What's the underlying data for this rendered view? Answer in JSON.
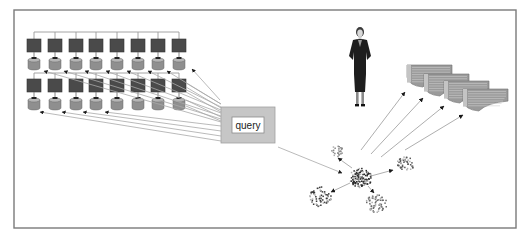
{
  "diagram": {
    "title": "",
    "frame": {
      "x": 14,
      "y": 10,
      "width": 502,
      "height": 218
    },
    "query_box": {
      "label": "query",
      "outer": {
        "x": 221,
        "y": 107,
        "width": 54,
        "height": 36
      },
      "inner": {
        "x": 232,
        "y": 117,
        "width": 32,
        "height": 16
      }
    },
    "node_grid": {
      "rows": 2,
      "columns": 8,
      "column_x": [
        27,
        48,
        69,
        89,
        110,
        131,
        151,
        172
      ],
      "node_size": 14,
      "row_bus_y": [
        32,
        73
      ],
      "row_node_y": [
        39,
        79
      ],
      "row_disk_y": [
        58,
        98
      ],
      "node_type": "server",
      "disk_type": "database"
    },
    "grid_arrows": [
      {
        "from": [
          220,
          100
        ],
        "to": [
          192,
          69
        ]
      },
      {
        "from": [
          221,
          104
        ],
        "to": [
          167,
          71
        ]
      },
      {
        "from": [
          221,
          107
        ],
        "to": [
          148,
          71
        ]
      },
      {
        "from": [
          221,
          110
        ],
        "to": [
          127,
          71
        ]
      },
      {
        "from": [
          221,
          113
        ],
        "to": [
          106,
          71
        ]
      },
      {
        "from": [
          221,
          116
        ],
        "to": [
          85,
          71
        ]
      },
      {
        "from": [
          221,
          119
        ],
        "to": [
          64,
          71
        ]
      },
      {
        "from": [
          221,
          122
        ],
        "to": [
          44,
          71
        ]
      },
      {
        "from": [
          221,
          126
        ],
        "to": [
          105,
          112
        ]
      },
      {
        "from": [
          221,
          131
        ],
        "to": [
          83,
          112
        ]
      },
      {
        "from": [
          221,
          136
        ],
        "to": [
          62,
          112
        ]
      },
      {
        "from": [
          221,
          141
        ],
        "to": [
          40,
          112
        ]
      }
    ],
    "grid_side_lines": [
      {
        "from": [
          221,
          104
        ],
        "to": [
          186,
          83
        ]
      },
      {
        "from": [
          221,
          108
        ],
        "to": [
          186,
          87
        ]
      },
      {
        "from": [
          221,
          112
        ],
        "to": [
          186,
          92
        ]
      },
      {
        "from": [
          221,
          117
        ],
        "to": [
          186,
          100
        ]
      },
      {
        "from": [
          221,
          121
        ],
        "to": [
          186,
          106
        ]
      }
    ],
    "person": {
      "name": "user",
      "x": 347,
      "y": 26,
      "width": 26,
      "height": 81
    },
    "reports": {
      "count": 4,
      "items": [
        {
          "x": 407,
          "y": 65,
          "width": 45,
          "height": 22
        },
        {
          "x": 424,
          "y": 74,
          "width": 45,
          "height": 22
        },
        {
          "x": 444,
          "y": 81,
          "width": 45,
          "height": 22
        },
        {
          "x": 463,
          "y": 89,
          "width": 45,
          "height": 22
        }
      ]
    },
    "report_arrows": [
      {
        "from": [
          361,
          150
        ],
        "to": [
          405,
          92
        ]
      },
      {
        "from": [
          371,
          154
        ],
        "to": [
          423,
          98
        ]
      },
      {
        "from": [
          381,
          157
        ],
        "to": [
          444,
          106
        ]
      },
      {
        "from": [
          405,
          150
        ],
        "to": [
          463,
          115
        ]
      }
    ],
    "query_to_cluster_arrow": {
      "from": [
        278,
        147
      ],
      "to": [
        342,
        173
      ]
    },
    "clusters": [
      {
        "name": "central-cluster",
        "cx": 360,
        "cy": 177,
        "rx": 11,
        "ry": 10,
        "n": 120,
        "shade": "#2a2a2a",
        "seed": 7
      },
      {
        "name": "top-cluster",
        "cx": 336,
        "cy": 150,
        "rx": 6,
        "ry": 6,
        "n": 26,
        "shade": "#8a8a8a",
        "seed": 3
      },
      {
        "name": "right-cluster",
        "cx": 405,
        "cy": 163,
        "rx": 9,
        "ry": 7,
        "n": 45,
        "shade": "#5a5a5a",
        "seed": 11
      },
      {
        "name": "left-cluster",
        "cx": 320,
        "cy": 196,
        "rx": 11,
        "ry": 10,
        "n": 70,
        "shade": "#3a3a3a",
        "seed": 19
      },
      {
        "name": "bottom-cluster",
        "cx": 376,
        "cy": 203,
        "rx": 11,
        "ry": 9,
        "n": 65,
        "shade": "#6a6a6a",
        "seed": 23
      }
    ],
    "cluster_arrows": [
      {
        "from": [
          352,
          168
        ],
        "to": [
          338,
          158
        ]
      },
      {
        "from": [
          371,
          176
        ],
        "to": [
          393,
          170
        ]
      },
      {
        "from": [
          350,
          183
        ],
        "to": [
          331,
          192
        ]
      },
      {
        "from": [
          368,
          186
        ],
        "to": [
          374,
          193
        ]
      }
    ],
    "colors": {
      "frame": "#7a7a7a",
      "server": "#4a4a4a",
      "disk": "#8f8f8f",
      "query_fill": "#c6c6c6",
      "line": "#a8a8a8",
      "arrowhead": "#1a1a1a",
      "person": "#1e1e1e"
    }
  }
}
